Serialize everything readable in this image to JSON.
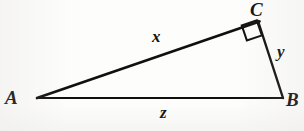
{
  "figure": {
    "kind": "right-triangle-diagram",
    "background_color": "#fdfdfc",
    "stroke_color": "#12100f",
    "vertices": {
      "A": {
        "label": "A",
        "x": 37,
        "y": 98
      },
      "B": {
        "label": "B",
        "x": 283,
        "y": 98
      },
      "C": {
        "label": "C",
        "x": 258,
        "y": 21
      }
    },
    "sides": {
      "AC": {
        "label": "x",
        "from": "A",
        "to": "C"
      },
      "CB": {
        "label": "y",
        "from": "C",
        "to": "B"
      },
      "AB": {
        "label": "z",
        "from": "A",
        "to": "B"
      }
    },
    "right_angle": {
      "at_vertex": "C",
      "marker": "square",
      "marker_name": "right-angle-marker"
    }
  }
}
